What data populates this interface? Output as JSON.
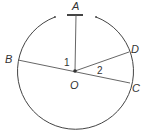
{
  "diagram": {
    "type": "geometry-circle",
    "center": {
      "label": "O",
      "x": 75,
      "y": 71
    },
    "radius": 58,
    "points": {
      "A": {
        "label": "A"
      },
      "B": {
        "label": "B"
      },
      "C": {
        "label": "C"
      },
      "D": {
        "label": "D"
      }
    },
    "angles": {
      "angle1": {
        "label": "1"
      },
      "angle2": {
        "label": "2"
      }
    },
    "colors": {
      "stroke": "#444444",
      "text": "#333333"
    }
  }
}
